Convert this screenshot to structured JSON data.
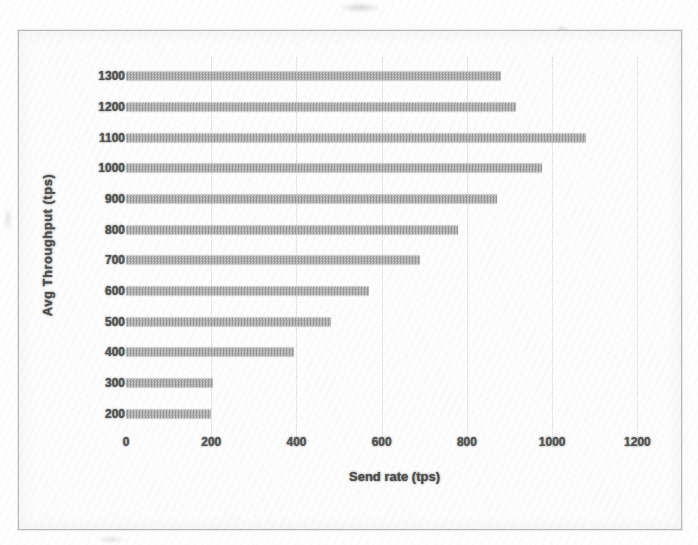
{
  "chart_data": {
    "type": "bar",
    "orientation": "horizontal",
    "title": "",
    "xlabel": "Send rate (tps)",
    "ylabel": "Avg Throughput (tps)",
    "categories": [
      "1300",
      "1200",
      "1100",
      "1000",
      "900",
      "800",
      "700",
      "600",
      "500",
      "400",
      "300",
      "200"
    ],
    "values": [
      880,
      915,
      1080,
      975,
      870,
      780,
      690,
      570,
      480,
      395,
      205,
      200
    ],
    "xticks": [
      "0",
      "200",
      "400",
      "600",
      "800",
      "1000",
      "1200"
    ],
    "xlim": [
      0,
      1200
    ],
    "grid": "vertical-dotted",
    "legend": "none",
    "colors": {
      "bar": "#989898",
      "bar_halftone": "#cacaca",
      "text": "#555555",
      "gridline": "#d4d4d4",
      "border": "#b8b8b8",
      "background": "#fdfdfd"
    }
  }
}
